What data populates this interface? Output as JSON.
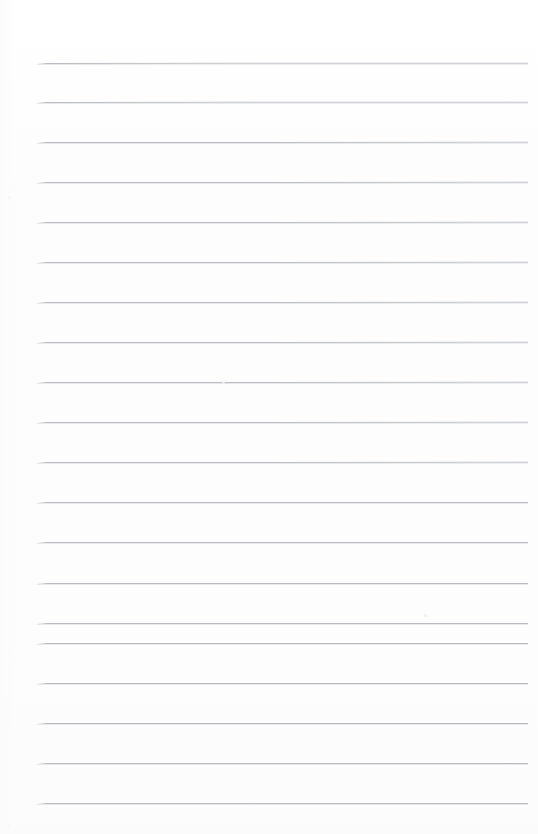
{
  "document": {
    "kind": "scanned-lined-paper",
    "title": "Blank ruled notebook page",
    "page_width": 538,
    "page_height": 834,
    "background_color": "#fdfdfd",
    "has_text": false,
    "has_handwriting": false,
    "visible_text": ""
  },
  "ruling": {
    "line_color": "#b9bdc1",
    "line_halo_color": "#e6e8ea",
    "line_thickness": 1,
    "line_count": 19,
    "spacing": 40,
    "first_line_y": 63,
    "last_line_y": 803,
    "left_x": 37,
    "right_x": 528,
    "margin_line_present": false,
    "top_margin": 63,
    "bottom_margin": 31,
    "lines": [
      {
        "index": 1,
        "y": 63,
        "left": 37,
        "right": 528,
        "tilt": 0.6
      },
      {
        "index": 2,
        "y": 102,
        "left": 37,
        "right": 528,
        "tilt": 0.6
      },
      {
        "index": 3,
        "y": 142,
        "left": 37,
        "right": 528,
        "tilt": 0.5
      },
      {
        "index": 4,
        "y": 182,
        "left": 37,
        "right": 528,
        "tilt": 0.5
      },
      {
        "index": 5,
        "y": 222,
        "left": 37,
        "right": 528,
        "tilt": 0.5
      },
      {
        "index": 6,
        "y": 262,
        "left": 37,
        "right": 528,
        "tilt": 0.4
      },
      {
        "index": 7,
        "y": 302,
        "left": 37,
        "right": 528,
        "tilt": 0.4
      },
      {
        "index": 8,
        "y": 342,
        "left": 37,
        "right": 528,
        "tilt": 0.4
      },
      {
        "index": 9,
        "y": 382,
        "left": 37,
        "right": 528,
        "tilt": 0.3
      },
      {
        "index": 10,
        "y": 422,
        "left": 37,
        "right": 528,
        "tilt": 0.3
      },
      {
        "index": 11,
        "y": 462,
        "left": 37,
        "right": 528,
        "tilt": 0.3
      },
      {
        "index": 12,
        "y": 502,
        "left": 37,
        "right": 528,
        "tilt": 0.2
      },
      {
        "index": 13,
        "y": 542,
        "left": 37,
        "right": 528,
        "tilt": 0.2
      },
      {
        "index": 14,
        "y": 583,
        "left": 37,
        "right": 528,
        "tilt": 0.2
      },
      {
        "index": 15,
        "y": 623,
        "left": 37,
        "right": 528,
        "tilt": 0.1
      },
      {
        "index": 16,
        "y": 643,
        "left": 37,
        "right": 528,
        "tilt": 0.1
      },
      {
        "index": 17,
        "y": 683,
        "left": 37,
        "right": 528,
        "tilt": 0.1
      },
      {
        "index": 18,
        "y": 723,
        "left": 37,
        "right": 528,
        "tilt": 0.0
      },
      {
        "index": 19,
        "y": 763,
        "left": 37,
        "right": 528,
        "tilt": 0.0
      },
      {
        "index": 20,
        "y": 803,
        "left": 37,
        "right": 528,
        "tilt": 0.0
      }
    ]
  },
  "artifacts": {
    "specks": [
      {
        "x": 222,
        "y": 381,
        "size": 3,
        "color": "#ededef"
      },
      {
        "x": 424,
        "y": 614,
        "size": 3,
        "color": "#f0f0f2"
      },
      {
        "x": 6,
        "y": 824,
        "size": 4,
        "color": "#f1f1f3"
      },
      {
        "x": 8,
        "y": 196,
        "size": 3,
        "color": "#f2f2f4"
      }
    ]
  }
}
